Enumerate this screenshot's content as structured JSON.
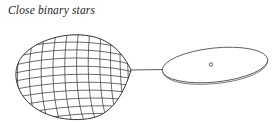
{
  "figure": {
    "caption": "Close binary stars",
    "background_color": "#ffffff",
    "line_color": "#3a3a3c",
    "width_px": 272,
    "height_px": 129
  },
  "diagram": {
    "type": "astronomy-schematic",
    "title": "Close binary stars",
    "objects": [
      {
        "name": "donor-star",
        "label": "",
        "shape": "teardrop-roche-lobe-wireframe",
        "description": "Tidally distorted star filling its Roche lobe, drawn as a wireframe mesh, tip pointing right",
        "bounds_px": {
          "x": 17,
          "y": 35,
          "width": 114,
          "height": 86
        },
        "tip_px": {
          "x": 131,
          "y": 70
        },
        "mesh": {
          "meridians": 11,
          "parallels": 11,
          "stroke": "#3a3a3c"
        }
      },
      {
        "name": "mass-transfer-stream",
        "label": "",
        "shape": "line",
        "description": "Thin stream of material flowing from the donor star to the accretion disk",
        "from_px": {
          "x": 131,
          "y": 70
        },
        "to_px": {
          "x": 164,
          "y": 70
        }
      },
      {
        "name": "accretion-disk",
        "label": "",
        "shape": "tilted-ellipse-with-rim",
        "description": "Flattened accretion disk seen at a shallow angle, with visible rim thickness",
        "center_px": {
          "x": 215,
          "y": 65
        },
        "radius_x_px": 53,
        "radius_y_px": 17,
        "tilt_deg": -6,
        "rim_depth_px": 5
      },
      {
        "name": "compact-object",
        "label": "",
        "shape": "small-circle",
        "description": "Compact accreting star at the centre of the disk",
        "center_px": {
          "x": 211,
          "y": 65
        },
        "radius_px": 1.7
      }
    ]
  }
}
